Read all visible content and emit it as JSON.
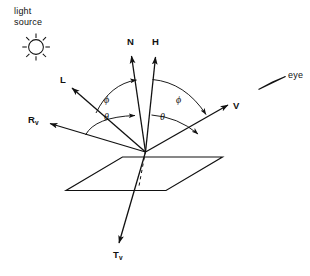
{
  "figure": {
    "background_color": "#ffffff",
    "ink_color": "#111111",
    "type": "vector-diagram"
  },
  "annotations": {
    "light_source": {
      "line1": "light",
      "line2": "source",
      "icon": "sun-icon"
    },
    "eye": {
      "label": "eye",
      "icon": "eye-arrow-icon"
    }
  },
  "vectors": [
    {
      "id": "N",
      "label": "N",
      "sub": "",
      "name": "surface-normal-vector"
    },
    {
      "id": "H",
      "label": "H",
      "sub": "",
      "name": "halfway-vector"
    },
    {
      "id": "L",
      "label": "L",
      "sub": "",
      "name": "light-direction-vector"
    },
    {
      "id": "V",
      "label": "V",
      "sub": "",
      "name": "view-direction-vector"
    },
    {
      "id": "Rv",
      "label": "R",
      "sub": "v",
      "name": "reflection-vector"
    },
    {
      "id": "Tv",
      "label": "T",
      "sub": "v",
      "name": "transmission-vector"
    }
  ],
  "angles": [
    {
      "id": "phi-left",
      "symbol": "ϕ",
      "name": "phi-left-angle"
    },
    {
      "id": "phi-right",
      "symbol": "ϕ",
      "name": "phi-right-angle"
    },
    {
      "id": "theta-left",
      "symbol": "θ",
      "name": "theta-left-angle"
    },
    {
      "id": "theta-right",
      "symbol": "θ",
      "name": "theta-right-angle"
    }
  ],
  "surface": {
    "name": "surface-plane",
    "shape": "parallelogram"
  }
}
